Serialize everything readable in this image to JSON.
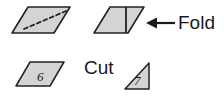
{
  "canvas": {
    "width": 224,
    "height": 101,
    "background": "#ffffff"
  },
  "style": {
    "shape_fill": "#d4d4d4",
    "shape_stroke": "#222222",
    "text_color": "#1a1a1a",
    "dash_stroke": "#222222"
  },
  "labels": {
    "fold": "Fold",
    "cut": "Cut",
    "arrow_left": "←"
  },
  "shapes": {
    "parallelogram_dashed": {
      "name": "parallelogram with dashed diagonal",
      "inner_line": "dashed-diagonal"
    },
    "parallelogram_fold": {
      "name": "parallelogram with solid fold line",
      "inner_line": "solid-vertical-fold"
    },
    "parallelogram_six": {
      "name": "small parallelogram labeled 6",
      "value": "6"
    },
    "triangle_seven": {
      "name": "right triangle labeled 7",
      "value": "7"
    }
  }
}
